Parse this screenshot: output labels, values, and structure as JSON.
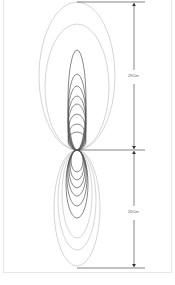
{
  "diagram": {
    "title": "",
    "dimensions": [
      {
        "label": "29Cm",
        "from_y": 2,
        "to_y": 150
      },
      {
        "label": "20Cm",
        "from_y": 152,
        "to_y": 268
      }
    ],
    "upper_lobes": [
      {
        "rx": 38,
        "ry": 74
      },
      {
        "rx": 32,
        "ry": 63
      },
      {
        "rx": 9,
        "ry": 50
      },
      {
        "rx": 9,
        "ry": 38
      },
      {
        "rx": 9,
        "ry": 32
      },
      {
        "rx": 9,
        "ry": 27
      },
      {
        "rx": 9,
        "ry": 23
      },
      {
        "rx": 9,
        "ry": 18
      },
      {
        "rx": 9,
        "ry": 13
      },
      {
        "rx": 9,
        "ry": 9
      }
    ],
    "lower_lobes": [
      {
        "rx": 23,
        "ry": 58
      },
      {
        "rx": 19,
        "ry": 50
      },
      {
        "rx": 15,
        "ry": 44
      },
      {
        "rx": 11,
        "ry": 34
      },
      {
        "rx": 10,
        "ry": 28
      },
      {
        "rx": 9,
        "ry": 23
      },
      {
        "rx": 8,
        "ry": 19
      },
      {
        "rx": 7,
        "ry": 15
      },
      {
        "rx": 6,
        "ry": 11
      }
    ],
    "colors": {
      "outer": "#b8b8b8",
      "inner": "#555555",
      "line": "#333333"
    }
  }
}
